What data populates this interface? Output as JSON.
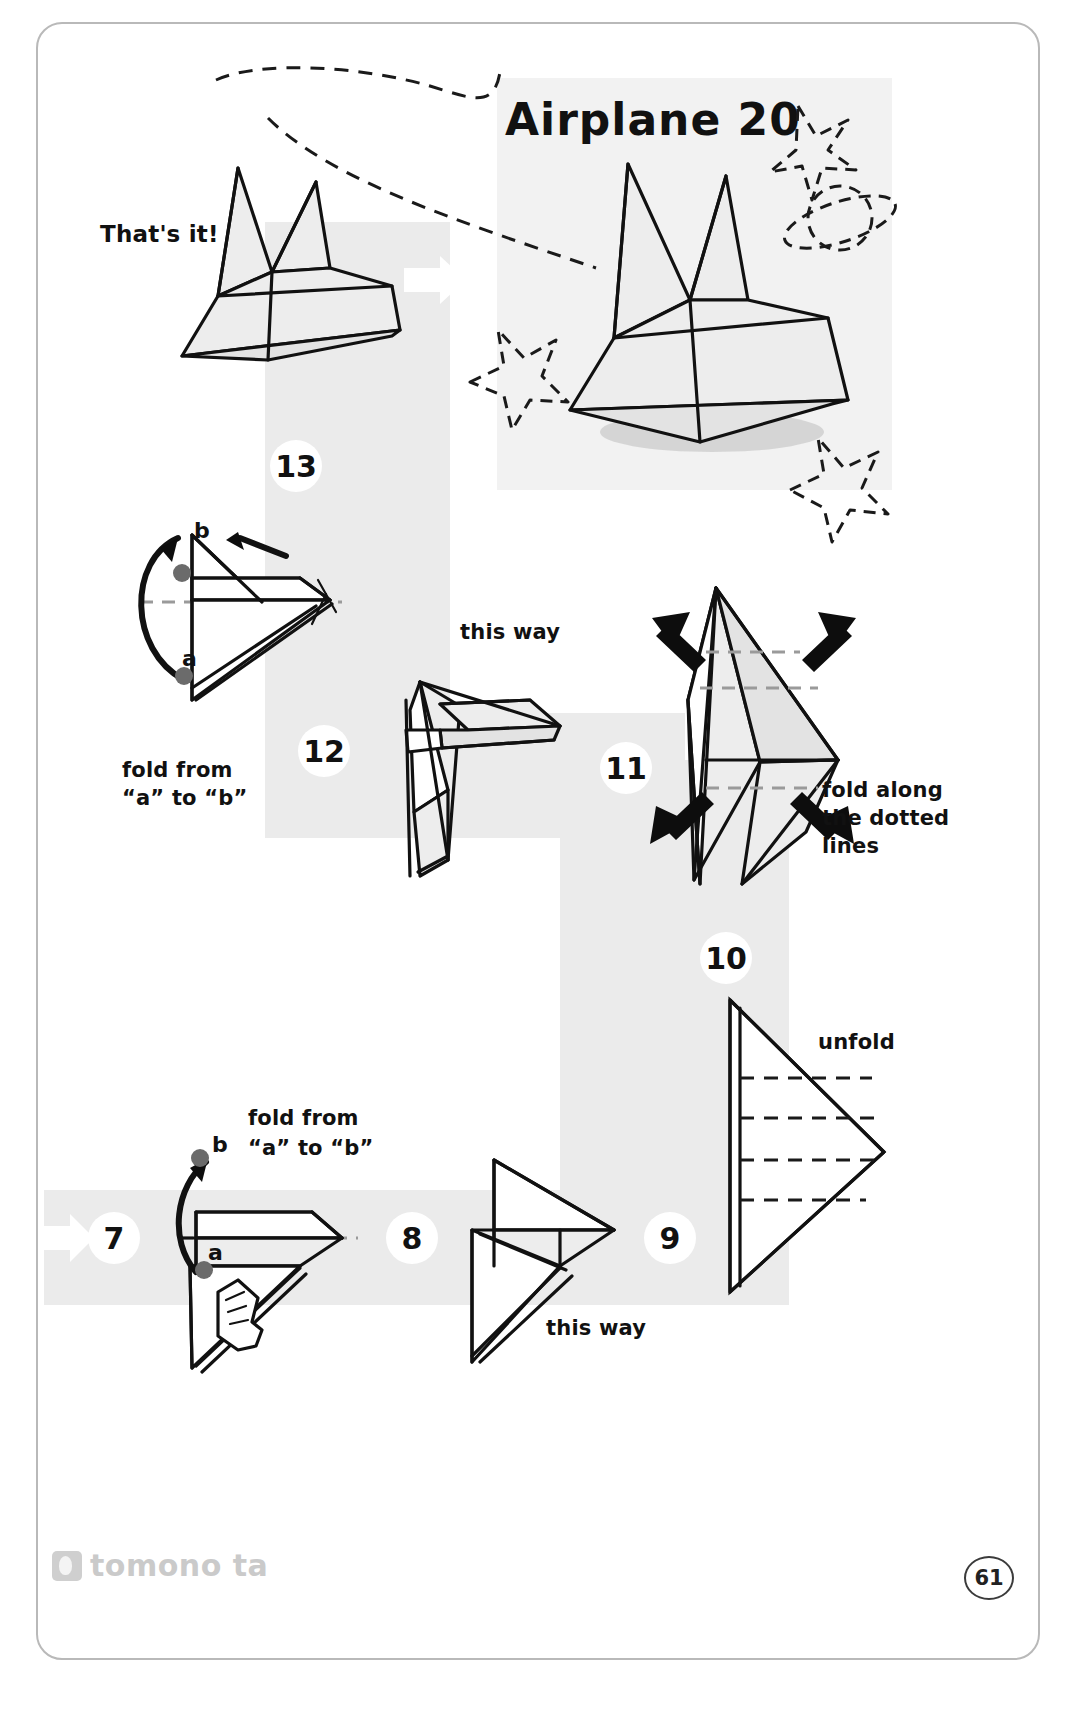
{
  "page": {
    "title": "Airplane 20",
    "page_number": "61",
    "brand": "tomono ta",
    "background_color": "#ffffff",
    "ribbon_color": "#ebebeb",
    "paper_fill": "#ededed",
    "ink_color": "#111111"
  },
  "labels": {
    "thats_it": "That's it!",
    "this_way_step12": "this way",
    "this_way_step8": "this way",
    "fold_a_to_b_line1_top": "fold from",
    "fold_a_to_b_line2_top": "“a” to “b”",
    "fold_a_to_b_line1_bottom": "fold from",
    "fold_a_to_b_line2_bottom": "“a” to “b”",
    "fold_dotted_line1": "fold along",
    "fold_dotted_line2": "the dotted",
    "fold_dotted_line3": "lines",
    "unfold": "unfold",
    "point_a_top": "a",
    "point_b_top": "b",
    "point_a_bottom": "a",
    "point_b_bottom": "b"
  },
  "steps": [
    {
      "number": "7",
      "caption": "fold from “a” to “b”"
    },
    {
      "number": "8",
      "caption": "this way"
    },
    {
      "number": "9",
      "caption": "unfold"
    },
    {
      "number": "10",
      "caption": "fold along the dotted lines"
    },
    {
      "number": "11",
      "caption": ""
    },
    {
      "number": "12",
      "caption": "this way"
    },
    {
      "number": "13",
      "caption": "fold from “a” to “b”"
    }
  ],
  "icons": {
    "star": "star-icon",
    "planet": "planet-icon",
    "hand": "hand-icon",
    "arrow_white": "white-arrow-icon",
    "arrow_black": "black-arrow-icon",
    "flight_path": "dashed-flight-path"
  }
}
